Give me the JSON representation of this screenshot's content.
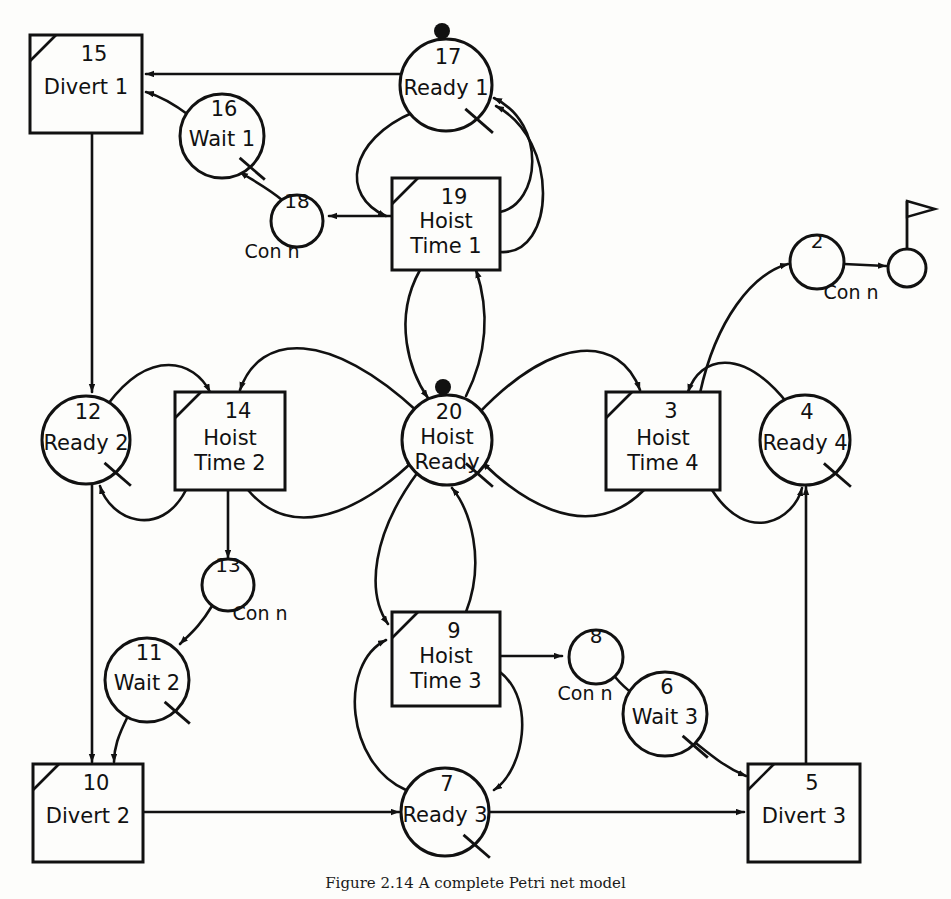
{
  "figure": {
    "caption": "Figure 2.14   A complete Petri net model",
    "type": "petri-net",
    "background": "#fdfdfb",
    "stroke": "#111111"
  },
  "legend": {
    "place_shape": "circle",
    "transition_shape": "square-with-corner-slash",
    "token_marker": "filled-dot",
    "inhibitor_marker": "slash-tick"
  },
  "nodes": [
    {
      "id": "n15",
      "num": "15",
      "line1": "Divert 1",
      "line2": "",
      "shape": "box",
      "x": 86,
      "y": 84,
      "w": 112,
      "h": 98,
      "corner_slash": true,
      "token": false,
      "tick": false
    },
    {
      "id": "n16",
      "num": "16",
      "line1": "Wait 1",
      "line2": "",
      "shape": "circle",
      "x": 222,
      "y": 136,
      "r": 42,
      "token": false,
      "tick": true
    },
    {
      "id": "n17",
      "num": "17",
      "line1": "Ready 1",
      "line2": "",
      "shape": "circle",
      "x": 446,
      "y": 85,
      "r": 46,
      "token": true,
      "tick": true
    },
    {
      "id": "n18",
      "num": "18",
      "line1": "",
      "line2": "",
      "shape": "circle",
      "x": 297,
      "y": 221,
      "r": 26,
      "token": false,
      "tick": false,
      "sublabel": "Con n"
    },
    {
      "id": "n19",
      "num": "19",
      "line1": "Hoist",
      "line2": "Time 1",
      "shape": "box",
      "x": 446,
      "y": 224,
      "w": 108,
      "h": 92,
      "corner_slash": true,
      "token": false,
      "tick": false
    },
    {
      "id": "n2",
      "num": "2",
      "line1": "",
      "line2": "",
      "shape": "circle",
      "x": 817,
      "y": 262,
      "r": 27,
      "token": false,
      "tick": false,
      "sublabel": "Con n"
    },
    {
      "id": "nflag",
      "num": "",
      "line1": "",
      "line2": "",
      "shape": "flag",
      "x": 907,
      "y": 268,
      "r": 19,
      "token": false,
      "tick": false
    },
    {
      "id": "n12",
      "num": "12",
      "line1": "Ready 2",
      "line2": "",
      "shape": "circle",
      "x": 86,
      "y": 440,
      "r": 44,
      "token": false,
      "tick": true
    },
    {
      "id": "n14",
      "num": "14",
      "line1": "Hoist",
      "line2": "Time 2",
      "shape": "box",
      "x": 230,
      "y": 441,
      "w": 110,
      "h": 98,
      "corner_slash": true,
      "token": false,
      "tick": false
    },
    {
      "id": "n20",
      "num": "20",
      "line1": "Hoist",
      "line2": "Ready",
      "shape": "circle",
      "x": 447,
      "y": 440,
      "r": 45,
      "token": true,
      "tick": true
    },
    {
      "id": "n3",
      "num": "3",
      "line1": "Hoist",
      "line2": "Time 4",
      "shape": "box",
      "x": 663,
      "y": 441,
      "w": 114,
      "h": 98,
      "corner_slash": true,
      "token": false,
      "tick": false
    },
    {
      "id": "n4",
      "num": "4",
      "line1": "Ready 4",
      "line2": "",
      "shape": "circle",
      "x": 805,
      "y": 440,
      "r": 45,
      "token": false,
      "tick": true
    },
    {
      "id": "n13",
      "num": "13",
      "line1": "",
      "line2": "",
      "shape": "circle",
      "x": 228,
      "y": 585,
      "r": 26,
      "token": false,
      "tick": false,
      "sublabel": "Con n"
    },
    {
      "id": "n11",
      "num": "11",
      "line1": "Wait 2",
      "line2": "",
      "shape": "circle",
      "x": 147,
      "y": 680,
      "r": 42,
      "token": false,
      "tick": true
    },
    {
      "id": "n9",
      "num": "9",
      "line1": "Hoist",
      "line2": "Time 3",
      "shape": "box",
      "x": 446,
      "y": 659,
      "w": 108,
      "h": 94,
      "corner_slash": true,
      "token": false,
      "tick": false
    },
    {
      "id": "n8",
      "num": "8",
      "line1": "",
      "line2": "",
      "shape": "circle",
      "x": 596,
      "y": 657,
      "r": 27,
      "token": false,
      "tick": false,
      "sublabel": "Con n"
    },
    {
      "id": "n6",
      "num": "6",
      "line1": "Wait 3",
      "line2": "",
      "shape": "circle",
      "x": 665,
      "y": 714,
      "r": 42,
      "token": false,
      "tick": true
    },
    {
      "id": "n10",
      "num": "10",
      "line1": "Divert 2",
      "line2": "",
      "shape": "box",
      "x": 88,
      "y": 813,
      "w": 110,
      "h": 98,
      "corner_slash": true,
      "token": false,
      "tick": false
    },
    {
      "id": "n7",
      "num": "7",
      "line1": "Ready 3",
      "line2": "",
      "shape": "circle",
      "x": 445,
      "y": 812,
      "r": 44,
      "token": false,
      "tick": true
    },
    {
      "id": "n5",
      "num": "5",
      "line1": "Divert 3",
      "line2": "",
      "shape": "box",
      "x": 804,
      "y": 813,
      "w": 112,
      "h": 98,
      "corner_slash": true,
      "token": false,
      "tick": false
    }
  ],
  "sublabels": [
    {
      "text": "Con n",
      "x": 272,
      "y": 258
    },
    {
      "text": "Con n",
      "x": 851,
      "y": 299
    },
    {
      "text": "Con n",
      "x": 260,
      "y": 620
    },
    {
      "text": "Con n",
      "x": 585,
      "y": 700
    }
  ],
  "arcs": [
    {
      "from": "n17",
      "to": "n15",
      "label": "ready1-to-divert1",
      "d": "M 400 74 L 146 74"
    },
    {
      "from": "n16",
      "to": "n15",
      "label": "wait1-to-divert1",
      "d": "M 190 116 C 174 104 160 96 146 92"
    },
    {
      "from": "n18",
      "to": "n16",
      "label": "conn18-to-wait1",
      "d": "M 282 200 C 268 188 252 180 240 172"
    },
    {
      "from": "n19",
      "to": "n18",
      "label": "hoisttime1-to-conn18",
      "d": "M 392 216 L 329 216"
    },
    {
      "from": "n17",
      "to": "n19",
      "label": "ready1-to-hoisttime1",
      "d": "M 414 112 C 348 140 340 196 386 216"
    },
    {
      "from": "n19",
      "to": "n17",
      "label": "hoisttime1-to-ready1",
      "d": "M 500 212 C 540 204 548 124 494 98"
    },
    {
      "from": "n19",
      "to": "n17b",
      "label": "hoisttime1-loop-ready1",
      "d": "M 500 252 C 556 256 560 140 496 106"
    },
    {
      "from": "n19",
      "to": "n20",
      "label": "hoisttime1-to-hoistready",
      "d": "M 420 270 C 392 320 410 372 428 398"
    },
    {
      "from": "n20",
      "to": "n19",
      "label": "hoistready-to-hoisttime1",
      "d": "M 466 396 C 496 336 482 288 476 270"
    },
    {
      "from": "n3",
      "to": "n2",
      "label": "hoisttime4-to-conn2",
      "d": "M 700 393 C 716 320 752 274 788 264"
    },
    {
      "from": "n2",
      "to": "nflag",
      "label": "conn2-to-flag",
      "d": "M 844 264 L 886 266"
    },
    {
      "from": "n15",
      "to": "n12",
      "label": "divert1-to-ready2",
      "d": "M 92 133 L 92 392"
    },
    {
      "from": "n12",
      "to": "n14",
      "label": "ready2-to-hoisttime2",
      "d": "M 108 404 C 150 348 194 360 210 392"
    },
    {
      "from": "n14",
      "to": "n12",
      "label": "hoisttime2-to-ready2",
      "d": "M 186 490 C 160 540 110 520 100 486"
    },
    {
      "from": "n20",
      "to": "n14",
      "label": "hoistready-to-hoisttime2",
      "d": "M 418 412 C 330 330 260 332 240 390"
    },
    {
      "from": "n14",
      "to": "n20",
      "label": "hoisttime2-to-hoistready",
      "d": "M 248 490 C 300 552 380 494 414 460"
    },
    {
      "from": "n14",
      "to": "n13",
      "label": "hoisttime2-to-conn13",
      "d": "M 228 490 L 228 558"
    },
    {
      "from": "n13",
      "to": "n11",
      "label": "conn13-to-wait2",
      "d": "M 212 606 C 200 626 190 634 180 644"
    },
    {
      "from": "n11",
      "to": "n10",
      "label": "wait2-to-divert2",
      "d": "M 128 716 C 118 736 114 748 114 762"
    },
    {
      "from": "n12",
      "to": "n10",
      "label": "ready2-to-divert2",
      "d": "M 92 484 L 92 762"
    },
    {
      "from": "n20",
      "to": "n9",
      "label": "hoistready-to-hoisttime3",
      "d": "M 418 472 C 372 534 366 592 388 624"
    },
    {
      "from": "n9",
      "to": "n20",
      "label": "hoisttime3-to-hoistready",
      "d": "M 466 612 C 486 560 470 510 452 488"
    },
    {
      "from": "n9",
      "to": "n8",
      "label": "hoisttime3-to-conn8",
      "d": "M 500 656 L 562 656"
    },
    {
      "from": "n8",
      "to": "n6",
      "label": "conn8-to-wait3",
      "d": "M 616 678 C 626 690 634 694 640 700"
    },
    {
      "from": "n9",
      "to": "n7",
      "label": "hoisttime3-to-ready3",
      "d": "M 500 672 C 536 700 524 770 494 790"
    },
    {
      "from": "n7",
      "to": "n9",
      "label": "ready3-to-hoisttime3",
      "d": "M 406 790 C 346 764 338 664 386 640"
    },
    {
      "from": "n6",
      "to": "n5",
      "label": "wait3-to-divert3",
      "d": "M 692 740 C 712 756 726 768 746 776"
    },
    {
      "from": "n7",
      "to": "n5",
      "label": "ready3-to-divert3",
      "d": "M 489 812 L 744 812"
    },
    {
      "from": "n10",
      "to": "n7",
      "label": "divert2-to-ready3",
      "d": "M 143 812 L 399 812"
    },
    {
      "from": "n5",
      "to": "n4",
      "label": "divert3-to-ready4",
      "d": "M 806 765 L 806 487"
    },
    {
      "from": "n4",
      "to": "n3",
      "label": "ready4-to-hoisttime4",
      "d": "M 788 404 C 742 346 700 356 688 392"
    },
    {
      "from": "n3",
      "to": "n4",
      "label": "hoisttime4-to-ready4",
      "d": "M 712 490 C 748 546 794 520 802 488"
    },
    {
      "from": "n20",
      "to": "n3",
      "label": "hoistready-to-hoisttime4",
      "d": "M 478 414 C 556 332 620 336 640 390"
    },
    {
      "from": "n3",
      "to": "n20",
      "label": "hoisttime4-to-hoistready",
      "d": "M 644 490 C 584 550 512 492 482 462"
    }
  ]
}
